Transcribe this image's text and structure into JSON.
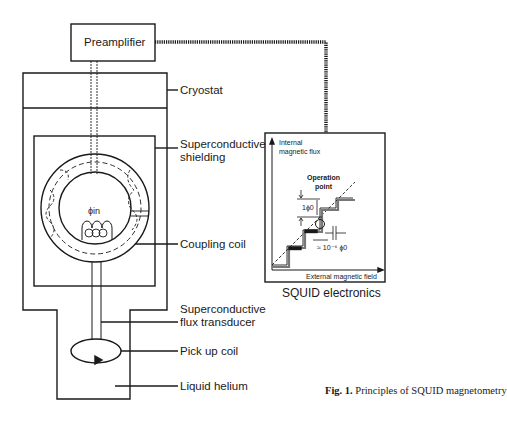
{
  "diagram": {
    "preamplifier": "Preamplifier",
    "labels": {
      "cryostat": "Cryostat",
      "shielding_1": "Superconductive",
      "shielding_2": "shielding",
      "coupling_coil": "Coupling coil",
      "transducer_1": "Superconductive",
      "transducer_2": "flux transducer",
      "pickup_coil": "Pick up coil",
      "liquid_helium": "Liquid helium",
      "phi_in": "ϕin",
      "squid_electronics": "SQUID electronics"
    },
    "graph": {
      "y_axis_1": "Internal",
      "y_axis_2": "magnetic flux",
      "x_axis": "External  magnetic field",
      "op_1": "Operation",
      "op_2": "point",
      "step": "1ϕ0",
      "resolution": "≈ 10⁻⁶ ϕ0"
    },
    "caption": {
      "prefix": "Fig. 1.",
      "text": " Principles of SQUID magnetometry"
    }
  }
}
